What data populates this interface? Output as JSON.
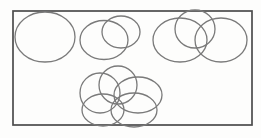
{
  "figure": {
    "canvas": {
      "width": 261,
      "height": 138,
      "background": "#fdfdfc"
    },
    "frame": {
      "x": 13,
      "y": 11,
      "width": 239,
      "height": 114,
      "stroke": "#4c4c4c",
      "stroke_width": 1.7,
      "fill": "none"
    },
    "ellipse_style": {
      "stroke": "#7a7a7a",
      "stroke_width": 1.3,
      "fill": "none"
    },
    "groups": [
      {
        "name": "single-ellipse-top-left",
        "ellipses": [
          {
            "cx": 45,
            "cy": 37,
            "rx": 30,
            "ry": 25
          }
        ]
      },
      {
        "name": "two-overlapping-top-middle",
        "ellipses": [
          {
            "cx": 104,
            "cy": 40,
            "rx": 24,
            "ry": 19.5
          },
          {
            "cx": 121,
            "cy": 32,
            "rx": 19,
            "ry": 16
          }
        ]
      },
      {
        "name": "three-overlapping-top-right",
        "ellipses": [
          {
            "cx": 180,
            "cy": 40,
            "rx": 27,
            "ry": 22
          },
          {
            "cx": 195,
            "cy": 29,
            "rx": 20,
            "ry": 19
          },
          {
            "cx": 221,
            "cy": 40,
            "rx": 26,
            "ry": 22
          }
        ]
      },
      {
        "name": "five-ring-cluster-bottom-center",
        "ellipses": [
          {
            "cx": 100,
            "cy": 93,
            "rx": 20,
            "ry": 20
          },
          {
            "cx": 118,
            "cy": 85,
            "rx": 19,
            "ry": 19
          },
          {
            "cx": 138,
            "cy": 95,
            "rx": 24,
            "ry": 18
          },
          {
            "cx": 134,
            "cy": 110,
            "rx": 23,
            "ry": 17
          },
          {
            "cx": 103,
            "cy": 110,
            "rx": 21,
            "ry": 16
          }
        ]
      }
    ]
  }
}
